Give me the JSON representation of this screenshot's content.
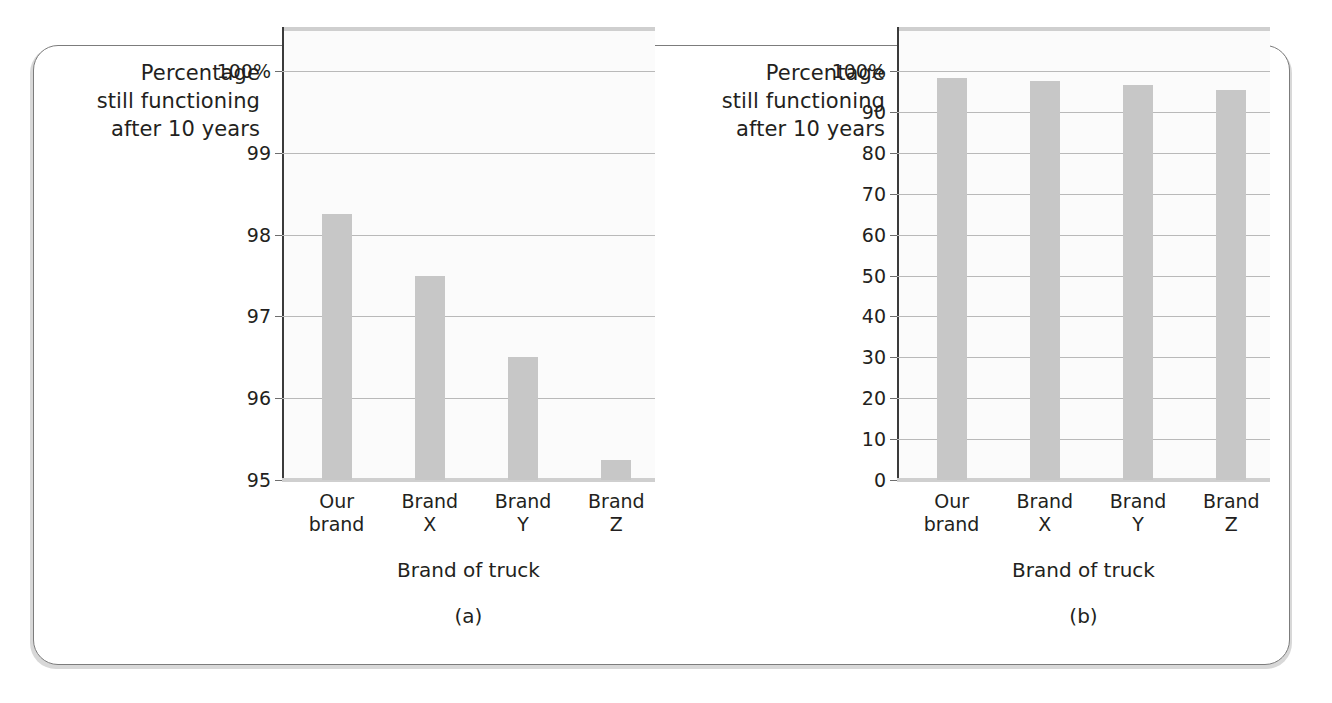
{
  "figure": {
    "background_color": "#ffffff",
    "frame_border_color": "#7c7c7c",
    "bar_color": "#c7c7c7",
    "gridline_color": "#b9b9b9",
    "text_color": "#231f20"
  },
  "panels": [
    {
      "id": "a",
      "caption": "(a)",
      "y_axis_title": "Percentage\nstill functioning\nafter 10 years",
      "x_axis_title": "Brand of truck",
      "y_ticks": [
        "100%",
        "99",
        "98",
        "97",
        "96",
        "95"
      ],
      "y_tick_values": [
        100,
        99,
        98,
        97,
        96,
        95
      ],
      "x_tick_labels": [
        "Our\nbrand",
        "Brand\nX",
        "Brand\nY",
        "Brand\nZ"
      ]
    },
    {
      "id": "b",
      "caption": "(b)",
      "y_axis_title": "Percentage\nstill functioning\nafter 10 years",
      "x_axis_title": "Brand of truck",
      "y_ticks": [
        "100%",
        "90",
        "80",
        "70",
        "60",
        "50",
        "40",
        "30",
        "20",
        "10",
        "0"
      ],
      "y_tick_values": [
        100,
        90,
        80,
        70,
        60,
        50,
        40,
        30,
        20,
        10,
        0
      ],
      "x_tick_labels": [
        "Our\nbrand",
        "Brand\nX",
        "Brand\nY",
        "Brand\nZ"
      ]
    }
  ],
  "chart_data": [
    {
      "type": "bar",
      "panel": "(a)",
      "title": "",
      "categories": [
        "Our brand",
        "Brand X",
        "Brand Y",
        "Brand Z"
      ],
      "values": [
        98.25,
        97.5,
        96.5,
        95.25
      ],
      "xlabel": "Brand of truck",
      "ylabel": "Percentage still functioning after 10 years",
      "ylim": [
        95,
        100
      ],
      "yticks": [
        95,
        96,
        97,
        98,
        99,
        100
      ],
      "ytick_labels": [
        "95",
        "96",
        "97",
        "98",
        "99",
        "100%"
      ],
      "grid": true,
      "legend": "none",
      "note": "Truncated y-axis (starts at 95) exaggerates differences between brands"
    },
    {
      "type": "bar",
      "panel": "(b)",
      "title": "",
      "categories": [
        "Our brand",
        "Brand X",
        "Brand Y",
        "Brand Z"
      ],
      "values": [
        98.25,
        97.5,
        96.5,
        95.25
      ],
      "xlabel": "Brand of truck",
      "ylabel": "Percentage still functioning after 10 years",
      "ylim": [
        0,
        100
      ],
      "yticks": [
        0,
        10,
        20,
        30,
        40,
        50,
        60,
        70,
        80,
        90,
        100
      ],
      "ytick_labels": [
        "0",
        "10",
        "20",
        "30",
        "40",
        "50",
        "60",
        "70",
        "80",
        "90",
        "100%"
      ],
      "grid": true,
      "legend": "none",
      "note": "Full y-axis (0 to 100) shows the differences are actually very small"
    }
  ]
}
